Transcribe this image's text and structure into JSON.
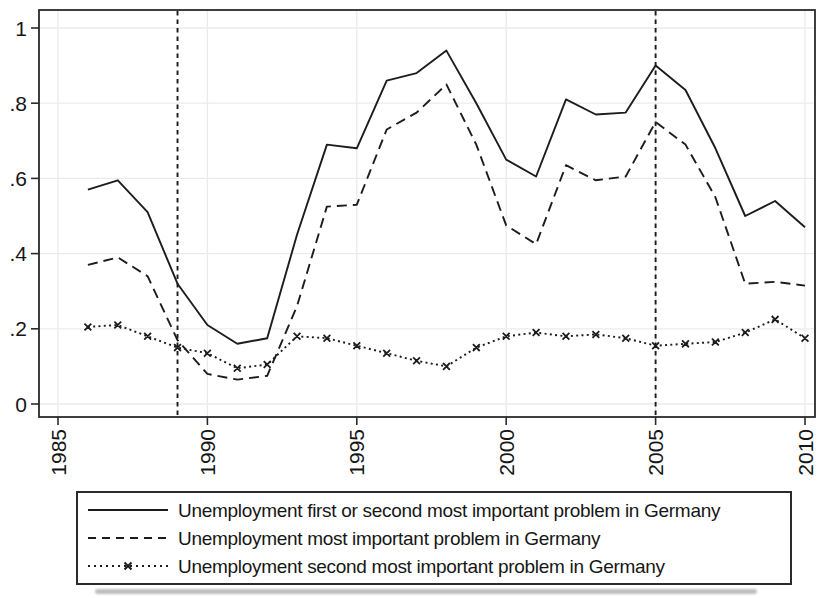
{
  "figure": {
    "background": "#ffffff",
    "line_color": "#1c1c1c",
    "axis_color": "#2b2b2b",
    "grid_color": "#ebebeb",
    "label_color": "#161616"
  },
  "chart_data": {
    "type": "line",
    "title": "",
    "xlabel": "",
    "ylabel": "",
    "xlim": [
      1985,
      2010
    ],
    "ylim": [
      0,
      1
    ],
    "grid": "faint dotted grid at ticks",
    "legend_position": "bottom-box",
    "x_ticks": [
      1985,
      1990,
      1995,
      2000,
      2005,
      2010
    ],
    "x_tick_labels": [
      "1985",
      "1990",
      "1995",
      "2000",
      "2005",
      "2010"
    ],
    "x_tick_label_rotation": 90,
    "y_ticks": [
      0,
      0.2,
      0.4,
      0.6,
      0.8,
      1
    ],
    "y_tick_labels": [
      "0",
      ".2",
      ".4",
      ".6",
      ".8",
      "1"
    ],
    "reference_lines_x": [
      1989,
      2005
    ],
    "x": [
      1986,
      1987,
      1988,
      1989,
      1990,
      1991,
      1992,
      1993,
      1994,
      1995,
      1996,
      1997,
      1998,
      1999,
      2000,
      2001,
      2002,
      2003,
      2004,
      2005,
      2006,
      2007,
      2008,
      2009,
      2010
    ],
    "series": [
      {
        "name": "Unemployment first or second most important problem in Germany",
        "line_style": "solid",
        "marker": "none",
        "values": [
          0.57,
          0.595,
          0.51,
          0.32,
          0.21,
          0.16,
          0.175,
          0.45,
          0.69,
          0.68,
          0.86,
          0.88,
          0.94,
          0.8,
          0.65,
          0.605,
          0.81,
          0.77,
          0.775,
          0.9,
          0.835,
          0.68,
          0.5,
          0.54,
          0.47
        ]
      },
      {
        "name": "Unemployment most important problem in Germany",
        "line_style": "dashed",
        "marker": "none",
        "values": [
          0.37,
          0.39,
          0.34,
          0.17,
          0.08,
          0.065,
          0.075,
          0.26,
          0.525,
          0.53,
          0.73,
          0.775,
          0.85,
          0.69,
          0.475,
          0.425,
          0.635,
          0.595,
          0.605,
          0.75,
          0.69,
          0.55,
          0.32,
          0.325,
          0.315
        ]
      },
      {
        "name": "Unemployment second most important problem in Germany",
        "line_style": "dotted",
        "marker": "x",
        "values": [
          0.205,
          0.21,
          0.18,
          0.15,
          0.135,
          0.095,
          0.105,
          0.18,
          0.175,
          0.155,
          0.135,
          0.115,
          0.1,
          0.15,
          0.18,
          0.19,
          0.18,
          0.185,
          0.175,
          0.155,
          0.16,
          0.165,
          0.19,
          0.225,
          0.175
        ]
      }
    ]
  }
}
